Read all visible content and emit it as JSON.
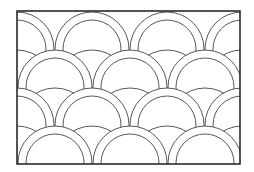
{
  "figure": {
    "kind": "clamshell quilt pattern line drawing",
    "colors": {
      "background": "#ffffff",
      "line": "#444444",
      "frame": "#2a2a2a"
    },
    "frame": {
      "x": 17,
      "y": 11,
      "width": 223,
      "height": 153
    },
    "shell": {
      "outer_radius": 37,
      "inner_radius": 29
    },
    "rows": [
      {
        "cy": 49,
        "shells": [
          17,
          92,
          167,
          242
        ],
        "bumps": []
      },
      {
        "cy": 87,
        "shells": [
          -20,
          55,
          130,
          205,
          280
        ],
        "bumps": [
          17,
          92,
          167,
          242
        ]
      },
      {
        "cy": 125,
        "shells": [
          17,
          92,
          167,
          242
        ],
        "bumps": [
          -20,
          55,
          130,
          205,
          280
        ]
      },
      {
        "cy": 163,
        "shells": [
          -20,
          55,
          130,
          205,
          280
        ],
        "bumps": [
          17,
          92,
          167,
          242
        ]
      }
    ]
  }
}
